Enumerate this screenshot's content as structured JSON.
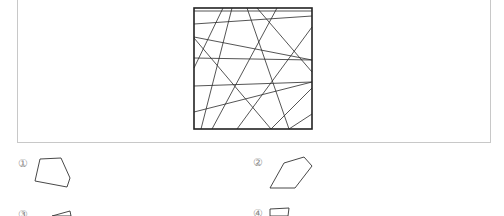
{
  "problem": {
    "figure": {
      "square": {
        "x": 194,
        "y": 8,
        "w": 118,
        "h": 121
      },
      "lines": [
        [
          194,
          11,
          312,
          11
        ],
        [
          194,
          24,
          312,
          16
        ],
        [
          194,
          37,
          312,
          60
        ],
        [
          194,
          58,
          312,
          60
        ],
        [
          194,
          86,
          312,
          82
        ],
        [
          194,
          112,
          312,
          82
        ],
        [
          194,
          38,
          271,
          129
        ],
        [
          194,
          68,
          223,
          8
        ],
        [
          201,
          129,
          232,
          8
        ],
        [
          212,
          129,
          277,
          8
        ],
        [
          237,
          129,
          312,
          27
        ],
        [
          247,
          8,
          289,
          129
        ],
        [
          257,
          8,
          312,
          72
        ],
        [
          289,
          129,
          312,
          114
        ],
        [
          271,
          129,
          312,
          88
        ]
      ]
    },
    "options": [
      {
        "label": "①",
        "x": 18,
        "y": 158,
        "points": "40,159 61,158 70,178 67,187 35,181"
      },
      {
        "label": "②",
        "x": 253,
        "y": 157,
        "points": "284,163 304,157 312,166 295,188 270,188"
      },
      {
        "label": "③",
        "x": 18,
        "y": 209,
        "points": "52,216 70,211 71,216"
      },
      {
        "label": "④",
        "x": 253,
        "y": 208,
        "points": "270,216 270,209 289,208 288,216"
      }
    ]
  }
}
